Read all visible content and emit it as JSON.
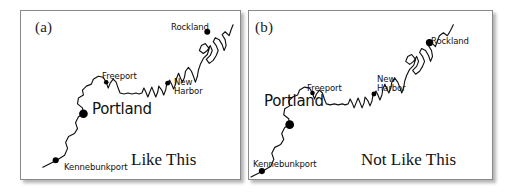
{
  "figure": {
    "background_color": "#ffffff",
    "line_color": "#111111",
    "dot_color": "#000000",
    "border_color": "#8a8a8a"
  },
  "panels": [
    {
      "letter": "(a)",
      "caption": "Like This",
      "labels": {
        "rockland": "Rockland",
        "freeport": "Freeport",
        "new_harbor_line1": "New",
        "new_harbor_line2": "Harbor",
        "portland": "Portland",
        "kennebunkport": "Kennebunkport"
      }
    },
    {
      "letter": "(b)",
      "caption": "Not Like This",
      "labels": {
        "rockland": "Rockland",
        "freeport": "Freeport",
        "new_harbor_line1": "New",
        "new_harbor_line2": "Harbor",
        "portland": "Portland",
        "kennebunkport": "Kennebunkport"
      }
    }
  ]
}
